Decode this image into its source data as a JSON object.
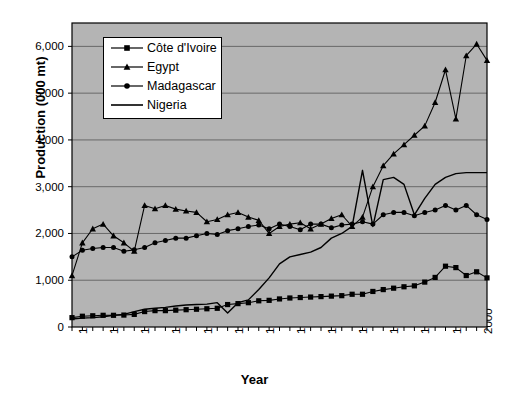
{
  "chart_data": {
    "type": "line",
    "title": "",
    "xlabel": "Year",
    "ylabel": "Production (000 mt)",
    "xlim": [
      1961,
      2001
    ],
    "ylim": [
      0,
      6500
    ],
    "yticks": [
      0,
      1000,
      2000,
      3000,
      4000,
      5000,
      6000
    ],
    "ytick_labels": [
      "0",
      "1,000",
      "2,000",
      "3,000",
      "4,000",
      "5,000",
      "6,000"
    ],
    "xticks": [
      1961,
      1964,
      1967,
      1970,
      1973,
      1976,
      1979,
      1982,
      1985,
      1988,
      1991,
      1994,
      1997,
      2000
    ],
    "xtick_labels": [
      "1961",
      "1964",
      "1967",
      "1970",
      "1973",
      "1976",
      "1979",
      "1982",
      "1985",
      "1988",
      "1991",
      "1994",
      "1997",
      "2000"
    ],
    "grid": "horizontal",
    "legend_position": "top-left-inside",
    "plot_background": "#b4b4b4",
    "line_color": "#000000",
    "x": [
      1961,
      1962,
      1963,
      1964,
      1965,
      1966,
      1967,
      1968,
      1969,
      1970,
      1971,
      1972,
      1973,
      1974,
      1975,
      1976,
      1977,
      1978,
      1979,
      1980,
      1981,
      1982,
      1983,
      1984,
      1985,
      1986,
      1987,
      1988,
      1989,
      1990,
      1991,
      1992,
      1993,
      1994,
      1995,
      1996,
      1997,
      1998,
      1999,
      2000,
      2001
    ],
    "series": [
      {
        "name": "Côte d'Ivoire",
        "marker": "square",
        "values": [
          200,
          230,
          240,
          250,
          250,
          255,
          270,
          330,
          350,
          350,
          360,
          370,
          380,
          390,
          400,
          480,
          500,
          520,
          560,
          570,
          600,
          620,
          630,
          640,
          650,
          660,
          670,
          700,
          700,
          760,
          800,
          830,
          860,
          880,
          960,
          1060,
          1300,
          1270,
          1100,
          1180,
          1050
        ]
      },
      {
        "name": "Egypt",
        "marker": "triangle",
        "values": [
          1100,
          1800,
          2100,
          2200,
          1950,
          1800,
          1620,
          2600,
          2530,
          2600,
          2520,
          2480,
          2450,
          2250,
          2300,
          2400,
          2450,
          2350,
          2280,
          2000,
          2150,
          2200,
          2230,
          2100,
          2200,
          2320,
          2400,
          2150,
          2350,
          3000,
          3450,
          3700,
          3900,
          4100,
          4300,
          4800,
          5500,
          4450,
          5800,
          6050,
          5700
        ]
      },
      {
        "name": "Madagascar",
        "marker": "circle",
        "values": [
          1500,
          1640,
          1680,
          1700,
          1700,
          1620,
          1650,
          1700,
          1800,
          1850,
          1900,
          1900,
          1950,
          2000,
          1980,
          2060,
          2100,
          2150,
          2180,
          2100,
          2200,
          2150,
          2080,
          2200,
          2200,
          2120,
          2180,
          2200,
          2250,
          2200,
          2400,
          2450,
          2450,
          2380,
          2450,
          2500,
          2600,
          2500,
          2600,
          2400,
          2300
        ]
      },
      {
        "name": "Nigeria",
        "marker": "none",
        "values": [
          170,
          190,
          200,
          220,
          250,
          270,
          330,
          380,
          400,
          420,
          450,
          470,
          480,
          490,
          520,
          300,
          520,
          580,
          800,
          1050,
          1350,
          1500,
          1550,
          1600,
          1700,
          1900,
          2000,
          2150,
          3350,
          2150,
          3150,
          3200,
          3050,
          2400,
          2750,
          3050,
          3200,
          3280,
          3300,
          3300,
          3300
        ]
      }
    ]
  },
  "legend": {
    "items": [
      {
        "label": "Côte d'Ivoire",
        "marker": "square"
      },
      {
        "label": "Egypt",
        "marker": "triangle"
      },
      {
        "label": "Madagascar",
        "marker": "circle"
      },
      {
        "label": "Nigeria",
        "marker": "none"
      }
    ]
  }
}
